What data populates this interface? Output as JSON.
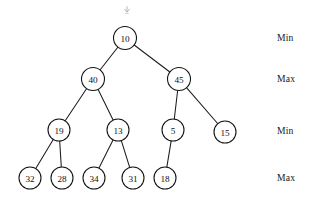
{
  "figure": {
    "kind": "min-max-heap-binary-tree",
    "background": "#ffffff",
    "stroke_color": "#151515",
    "text_color": "#111111",
    "width": 314,
    "height": 206
  },
  "top_marker": {
    "icon": "down-arrow-marker-icon",
    "x": 122,
    "y": 1
  },
  "nodes": [
    {
      "id": "n10",
      "label": "10",
      "x": 125,
      "y": 38,
      "r": 11.5,
      "level": 0
    },
    {
      "id": "n40",
      "label": "40",
      "x": 93,
      "y": 79,
      "r": 11.5,
      "level": 1
    },
    {
      "id": "n45",
      "label": "45",
      "x": 179,
      "y": 79,
      "r": 11.5,
      "level": 1
    },
    {
      "id": "n19",
      "label": "19",
      "x": 59,
      "y": 130,
      "r": 11.0,
      "level": 2
    },
    {
      "id": "n13",
      "label": "13",
      "x": 118,
      "y": 130,
      "r": 11.0,
      "level": 2
    },
    {
      "id": "n5",
      "label": "5",
      "x": 173,
      "y": 130,
      "r": 11.0,
      "level": 2
    },
    {
      "id": "n15",
      "label": "15",
      "x": 225,
      "y": 132,
      "r": 11.0,
      "level": 2
    },
    {
      "id": "n32",
      "label": "32",
      "x": 30,
      "y": 178,
      "r": 11.0,
      "level": 3
    },
    {
      "id": "n28",
      "label": "28",
      "x": 62,
      "y": 178,
      "r": 11.0,
      "level": 3
    },
    {
      "id": "n34",
      "label": "34",
      "x": 94,
      "y": 178,
      "r": 11.0,
      "level": 3
    },
    {
      "id": "n31",
      "label": "31",
      "x": 133,
      "y": 178,
      "r": 11.0,
      "level": 3
    },
    {
      "id": "n18",
      "label": "18",
      "x": 165,
      "y": 178,
      "r": 11.0,
      "level": 3
    }
  ],
  "edges": [
    {
      "from": "n10",
      "to": "n40"
    },
    {
      "from": "n10",
      "to": "n45"
    },
    {
      "from": "n40",
      "to": "n19"
    },
    {
      "from": "n40",
      "to": "n13"
    },
    {
      "from": "n45",
      "to": "n5"
    },
    {
      "from": "n45",
      "to": "n15"
    },
    {
      "from": "n19",
      "to": "n32"
    },
    {
      "from": "n19",
      "to": "n28"
    },
    {
      "from": "n13",
      "to": "n34"
    },
    {
      "from": "n13",
      "to": "n31"
    },
    {
      "from": "n5",
      "to": "n18"
    }
  ],
  "level_labels": [
    {
      "id": "lvl0",
      "text": "Min",
      "x": 277,
      "y": 32
    },
    {
      "id": "lvl1",
      "text": "Max",
      "x": 277,
      "y": 73
    },
    {
      "id": "lvl2",
      "text": "Min",
      "x": 277,
      "y": 125
    },
    {
      "id": "lvl3",
      "text": "Max",
      "x": 277,
      "y": 172
    }
  ]
}
